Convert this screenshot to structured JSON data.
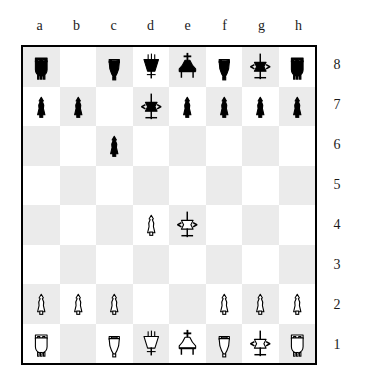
{
  "board": {
    "file_labels": [
      "a",
      "b",
      "c",
      "d",
      "e",
      "f",
      "g",
      "h"
    ],
    "rank_labels": [
      "8",
      "7",
      "6",
      "5",
      "4",
      "3",
      "2",
      "1"
    ],
    "light_square_color": "#ffffff",
    "dark_square_color": "#ebebeb",
    "border_color": "#000000",
    "piece_color_white": "#ffffff",
    "piece_color_black": "#000000",
    "piece_outline_color": "#000000",
    "orientation": "white-bottom",
    "ranks": [
      {
        "rank": "8",
        "squares": [
          {
            "square": "a8",
            "piece": "black-rook",
            "glyph": "♜"
          },
          {
            "square": "b8",
            "piece": null,
            "glyph": ""
          },
          {
            "square": "c8",
            "piece": "black-bishop",
            "glyph": "♝"
          },
          {
            "square": "d8",
            "piece": "black-queen",
            "glyph": "♛"
          },
          {
            "square": "e8",
            "piece": "black-king",
            "glyph": "♚"
          },
          {
            "square": "f8",
            "piece": "black-bishop",
            "glyph": "♝"
          },
          {
            "square": "g8",
            "piece": "black-knight",
            "glyph": "♞"
          },
          {
            "square": "h8",
            "piece": "black-rook",
            "glyph": "♜"
          }
        ]
      },
      {
        "rank": "7",
        "squares": [
          {
            "square": "a7",
            "piece": "black-pawn",
            "glyph": "♟"
          },
          {
            "square": "b7",
            "piece": "black-pawn",
            "glyph": "♟"
          },
          {
            "square": "c7",
            "piece": null,
            "glyph": ""
          },
          {
            "square": "d7",
            "piece": "black-knight",
            "glyph": "♞"
          },
          {
            "square": "e7",
            "piece": "black-pawn",
            "glyph": "♟"
          },
          {
            "square": "f7",
            "piece": "black-pawn",
            "glyph": "♟"
          },
          {
            "square": "g7",
            "piece": "black-pawn",
            "glyph": "♟"
          },
          {
            "square": "h7",
            "piece": "black-pawn",
            "glyph": "♟"
          }
        ]
      },
      {
        "rank": "6",
        "squares": [
          {
            "square": "a6",
            "piece": null,
            "glyph": ""
          },
          {
            "square": "b6",
            "piece": null,
            "glyph": ""
          },
          {
            "square": "c6",
            "piece": "black-pawn",
            "glyph": "♟"
          },
          {
            "square": "d6",
            "piece": null,
            "glyph": ""
          },
          {
            "square": "e6",
            "piece": null,
            "glyph": ""
          },
          {
            "square": "f6",
            "piece": null,
            "glyph": ""
          },
          {
            "square": "g6",
            "piece": null,
            "glyph": ""
          },
          {
            "square": "h6",
            "piece": null,
            "glyph": ""
          }
        ]
      },
      {
        "rank": "5",
        "squares": [
          {
            "square": "a5",
            "piece": null,
            "glyph": ""
          },
          {
            "square": "b5",
            "piece": null,
            "glyph": ""
          },
          {
            "square": "c5",
            "piece": null,
            "glyph": ""
          },
          {
            "square": "d5",
            "piece": null,
            "glyph": ""
          },
          {
            "square": "e5",
            "piece": null,
            "glyph": ""
          },
          {
            "square": "f5",
            "piece": null,
            "glyph": ""
          },
          {
            "square": "g5",
            "piece": null,
            "glyph": ""
          },
          {
            "square": "h5",
            "piece": null,
            "glyph": ""
          }
        ]
      },
      {
        "rank": "4",
        "squares": [
          {
            "square": "a4",
            "piece": null,
            "glyph": ""
          },
          {
            "square": "b4",
            "piece": null,
            "glyph": ""
          },
          {
            "square": "c4",
            "piece": null,
            "glyph": ""
          },
          {
            "square": "d4",
            "piece": "white-pawn",
            "glyph": "♙"
          },
          {
            "square": "e4",
            "piece": "white-knight",
            "glyph": "♘"
          },
          {
            "square": "f4",
            "piece": null,
            "glyph": ""
          },
          {
            "square": "g4",
            "piece": null,
            "glyph": ""
          },
          {
            "square": "h4",
            "piece": null,
            "glyph": ""
          }
        ]
      },
      {
        "rank": "3",
        "squares": [
          {
            "square": "a3",
            "piece": null,
            "glyph": ""
          },
          {
            "square": "b3",
            "piece": null,
            "glyph": ""
          },
          {
            "square": "c3",
            "piece": null,
            "glyph": ""
          },
          {
            "square": "d3",
            "piece": null,
            "glyph": ""
          },
          {
            "square": "e3",
            "piece": null,
            "glyph": ""
          },
          {
            "square": "f3",
            "piece": null,
            "glyph": ""
          },
          {
            "square": "g3",
            "piece": null,
            "glyph": ""
          },
          {
            "square": "h3",
            "piece": null,
            "glyph": ""
          }
        ]
      },
      {
        "rank": "2",
        "squares": [
          {
            "square": "a2",
            "piece": "white-pawn",
            "glyph": "♙"
          },
          {
            "square": "b2",
            "piece": "white-pawn",
            "glyph": "♙"
          },
          {
            "square": "c2",
            "piece": "white-pawn",
            "glyph": "♙"
          },
          {
            "square": "d2",
            "piece": null,
            "glyph": ""
          },
          {
            "square": "e2",
            "piece": null,
            "glyph": ""
          },
          {
            "square": "f2",
            "piece": "white-pawn",
            "glyph": "♙"
          },
          {
            "square": "g2",
            "piece": "white-pawn",
            "glyph": "♙"
          },
          {
            "square": "h2",
            "piece": "white-pawn",
            "glyph": "♙"
          }
        ]
      },
      {
        "rank": "1",
        "squares": [
          {
            "square": "a1",
            "piece": "white-rook",
            "glyph": "♖"
          },
          {
            "square": "b1",
            "piece": null,
            "glyph": ""
          },
          {
            "square": "c1",
            "piece": "white-bishop",
            "glyph": "♗"
          },
          {
            "square": "d1",
            "piece": "white-queen",
            "glyph": "♕"
          },
          {
            "square": "e1",
            "piece": "white-king",
            "glyph": "♔"
          },
          {
            "square": "f1",
            "piece": "white-bishop",
            "glyph": "♗"
          },
          {
            "square": "g1",
            "piece": "white-knight",
            "glyph": "♘"
          },
          {
            "square": "h1",
            "piece": "white-rook",
            "glyph": "♖"
          }
        ]
      }
    ]
  }
}
